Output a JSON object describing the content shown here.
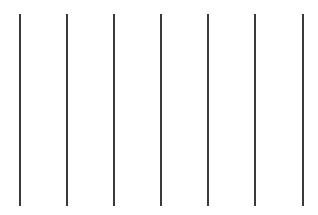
{
  "canvas": {
    "width": 318,
    "height": 215,
    "background": "#ffffff"
  },
  "lines": {
    "color": "#3a3a3a",
    "count": 7,
    "x_positions": [
      19,
      66,
      113,
      160,
      207,
      254,
      302
    ],
    "top": 14,
    "bottom": 206
  }
}
